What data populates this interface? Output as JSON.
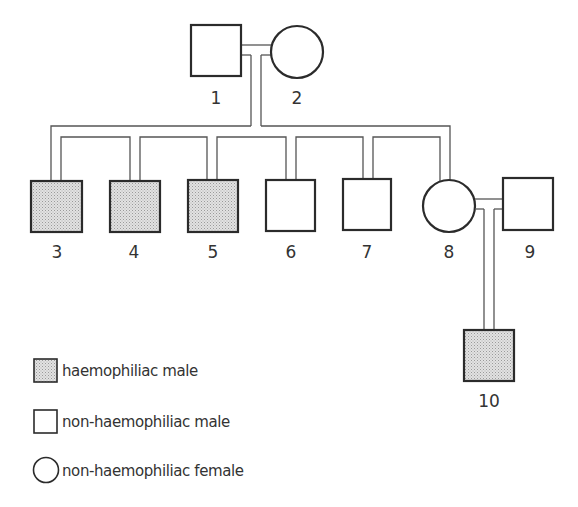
{
  "diagram": {
    "type": "pedigree",
    "title": "",
    "colors": {
      "stroke": "#2b2b2b",
      "line": "#555555",
      "affected_fill": "#d4d4d4",
      "unaffected_fill": "#ffffff",
      "text": "#333333"
    },
    "individuals": [
      {
        "id": "1",
        "label": "1",
        "sex": "male",
        "affected": false,
        "generation": 1
      },
      {
        "id": "2",
        "label": "2",
        "sex": "female",
        "affected": false,
        "generation": 1
      },
      {
        "id": "3",
        "label": "3",
        "sex": "male",
        "affected": true,
        "generation": 2
      },
      {
        "id": "4",
        "label": "4",
        "sex": "male",
        "affected": true,
        "generation": 2
      },
      {
        "id": "5",
        "label": "5",
        "sex": "male",
        "affected": true,
        "generation": 2
      },
      {
        "id": "6",
        "label": "6",
        "sex": "male",
        "affected": false,
        "generation": 2
      },
      {
        "id": "7",
        "label": "7",
        "sex": "male",
        "affected": false,
        "generation": 2
      },
      {
        "id": "8",
        "label": "8",
        "sex": "female",
        "affected": false,
        "generation": 2
      },
      {
        "id": "9",
        "label": "9",
        "sex": "male",
        "affected": false,
        "generation": 2
      },
      {
        "id": "10",
        "label": "10",
        "sex": "male",
        "affected": true,
        "generation": 3
      }
    ],
    "matings": [
      {
        "partners": [
          "1",
          "2"
        ],
        "children": [
          "3",
          "4",
          "5",
          "6",
          "7",
          "8"
        ]
      },
      {
        "partners": [
          "8",
          "9"
        ],
        "children": [
          "10"
        ]
      }
    ]
  },
  "legend": {
    "items": [
      {
        "symbol": "shaded-square",
        "label": "haemophiliac male"
      },
      {
        "symbol": "open-square",
        "label": "non-haemophiliac male"
      },
      {
        "symbol": "open-circle",
        "label": "non-haemophiliac female"
      }
    ]
  }
}
